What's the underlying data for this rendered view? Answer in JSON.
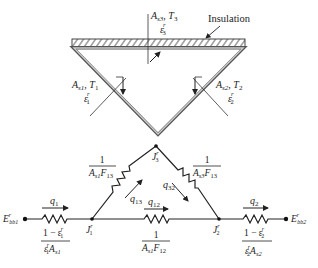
{
  "figure": {
    "top": {
      "insulation_label": "Insulation",
      "surface3": {
        "area": "A",
        "area_sub": "s3",
        "temp": "T",
        "temp_sub": "3",
        "emis": "ε",
        "emis_sup": "r",
        "emis_sub": "3"
      },
      "surface1": {
        "area": "A",
        "area_sub": "s1",
        "temp": "T",
        "temp_sub": "1",
        "emis": "ε",
        "emis_sup": "r",
        "emis_sub": "1"
      },
      "surface2": {
        "area": "A",
        "area_sub": "s2",
        "temp": "T",
        "temp_sub": "2",
        "emis": "ε",
        "emis_sup": "r",
        "emis_sub": "2"
      }
    },
    "network": {
      "nodes": {
        "ebb1": {
          "main": "E",
          "sup": "r",
          "sub": "bb1"
        },
        "j1": {
          "main": "J",
          "sup": "r",
          "sub": "1"
        },
        "j2": {
          "main": "J",
          "sup": "r",
          "sub": "2"
        },
        "j3": {
          "main": "J",
          "sup": "r",
          "sub": "3"
        },
        "ebb2": {
          "main": "E",
          "sup": "r",
          "sub": "bb2"
        }
      },
      "heat_flows": {
        "q1": {
          "main": "q",
          "sub": "1"
        },
        "q2": {
          "main": "q",
          "sub": "2"
        },
        "q12": {
          "main": "q",
          "sub": "12"
        },
        "q13": {
          "main": "q",
          "sub": "13"
        },
        "q32": {
          "main": "q",
          "sub": "32"
        }
      },
      "resistances": {
        "r1": {
          "num": "1 − ε",
          "num_sup": "r",
          "num_sub": "1",
          "den_e": "ε",
          "den_sup": "r",
          "den_sub": "1",
          "den_a": "A",
          "den_a_sub": "s1"
        },
        "r2": {
          "num": "1 − ε",
          "num_sup": "r",
          "num_sub": "2",
          "den_e": "ε",
          "den_sup": "r",
          "den_sub": "2",
          "den_a": "A",
          "den_a_sub": "s2"
        },
        "r12": {
          "num": "1",
          "den_a": "A",
          "den_a_sub": "s1",
          "den_f": "F",
          "den_f_sub": "12"
        },
        "r13": {
          "num": "1",
          "den_a": "A",
          "den_a_sub": "s1",
          "den_f": "F",
          "den_f_sub": "13"
        },
        "r32": {
          "num": "1",
          "den_a": "A",
          "den_a_sub": "s3",
          "den_f": "F",
          "den_f_sub": "13"
        }
      }
    }
  }
}
